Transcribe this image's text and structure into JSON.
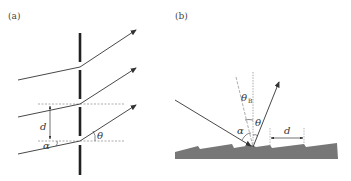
{
  "panels": [
    {
      "id": "a",
      "label": "(a)",
      "title": "Transmission grating",
      "symbols": {
        "spacing": "d",
        "incident_angle": "α",
        "diffraction_angle": "θ"
      }
    },
    {
      "id": "b",
      "label": "(b)",
      "title": "Blazed reflection grating",
      "symbols": {
        "spacing": "d",
        "incident_angle": "α",
        "diffraction_angle": "θ",
        "blaze_angle": "θ",
        "blaze_subscript": "B"
      }
    }
  ],
  "colors": {
    "line": "#333333",
    "grating": "#777777",
    "dashed": "#888888",
    "slit": "#222222"
  }
}
